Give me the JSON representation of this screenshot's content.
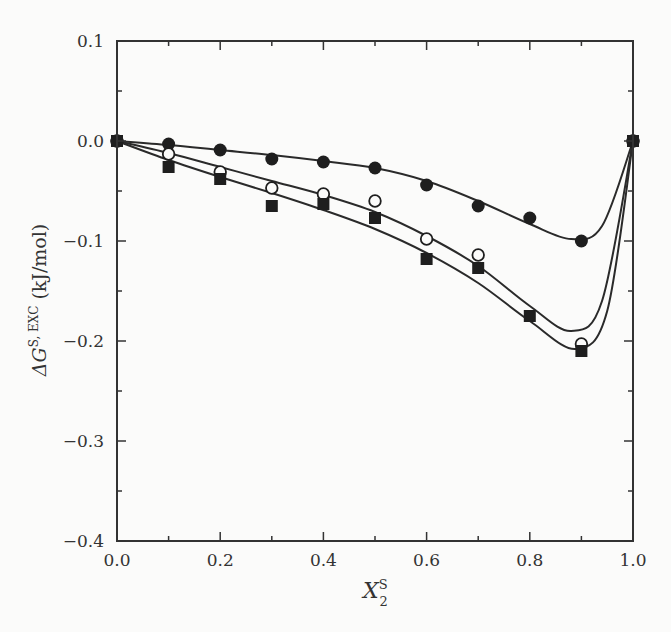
{
  "chart_data": {
    "type": "scatter",
    "title": "",
    "xlabel": "X_2^S",
    "xlabel_main": "X",
    "xlabel_sub": "2",
    "xlabel_sup": "S",
    "ylabel": "ΔG^{S, EXC} (kJ/mol)",
    "ylabel_prefix": "ΔG",
    "ylabel_sup": "S, EXC",
    "ylabel_unit": " (kJ/mol)",
    "xlim": [
      0.0,
      1.0
    ],
    "ylim": [
      -0.4,
      0.1
    ],
    "xticks": [
      "0.0",
      "0.2",
      "0.4",
      "0.6",
      "0.8",
      "1.0"
    ],
    "yticks": [
      "0.1",
      "0.0",
      "−0.1",
      "−0.2",
      "−0.3",
      "−0.4"
    ],
    "grid": false,
    "legend": null,
    "series": [
      {
        "name": "filled circles",
        "marker": "filled-circle",
        "x": [
          0.0,
          0.1,
          0.2,
          0.3,
          0.4,
          0.5,
          0.6,
          0.7,
          0.8,
          0.9,
          1.0
        ],
        "y": [
          0.0,
          -0.003,
          -0.009,
          -0.018,
          -0.021,
          -0.027,
          -0.044,
          -0.065,
          -0.077,
          -0.1,
          0.0
        ],
        "fit_curve": true
      },
      {
        "name": "open circles",
        "marker": "open-circle",
        "x": [
          0.0,
          0.1,
          0.2,
          0.3,
          0.4,
          0.5,
          0.6,
          0.7,
          0.9,
          1.0
        ],
        "y": [
          0.0,
          -0.013,
          -0.031,
          -0.047,
          -0.053,
          -0.06,
          -0.098,
          -0.114,
          -0.203,
          0.0
        ],
        "fit_curve": true
      },
      {
        "name": "filled squares",
        "marker": "filled-square",
        "x": [
          0.0,
          0.1,
          0.2,
          0.3,
          0.4,
          0.5,
          0.6,
          0.7,
          0.8,
          0.9,
          1.0
        ],
        "y": [
          0.0,
          -0.026,
          -0.038,
          -0.065,
          -0.063,
          -0.077,
          -0.118,
          -0.127,
          -0.175,
          -0.21,
          0.0
        ],
        "fit_curve": true
      }
    ]
  }
}
